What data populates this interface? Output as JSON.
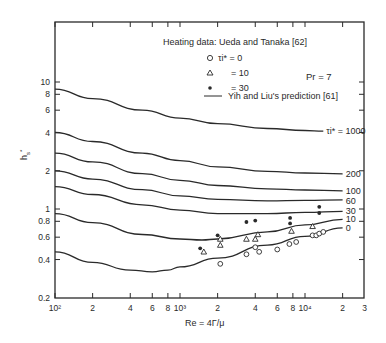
{
  "chart_data": {
    "type": "line",
    "title": "",
    "xlabel": "Re = 4Γ/μ",
    "ylabel": "h*_s",
    "xscale": "log",
    "yscale": "log",
    "xlim": [
      100,
      30000
    ],
    "ylim": [
      0.2,
      20
    ],
    "grid": false,
    "x_ticks": [
      {
        "v": 100,
        "label": "10²"
      },
      {
        "v": 200,
        "label": "2"
      },
      {
        "v": 400,
        "label": "4"
      },
      {
        "v": 600,
        "label": "6"
      },
      {
        "v": 800,
        "label": "8"
      },
      {
        "v": 1000,
        "label": "10³"
      },
      {
        "v": 2000,
        "label": "2"
      },
      {
        "v": 4000,
        "label": "4"
      },
      {
        "v": 6000,
        "label": "6"
      },
      {
        "v": 8000,
        "label": "8"
      },
      {
        "v": 10000,
        "label": "10⁴"
      },
      {
        "v": 20000,
        "label": "2"
      },
      {
        "v": 30000,
        "label": "3"
      }
    ],
    "y_ticks": [
      {
        "v": 0.2,
        "label": "0.2"
      },
      {
        "v": 0.4,
        "label": "0.4"
      },
      {
        "v": 0.6,
        "label": "0.6"
      },
      {
        "v": 0.8,
        "label": "0.8"
      },
      {
        "v": 1,
        "label": "1"
      },
      {
        "v": 2,
        "label": "2"
      },
      {
        "v": 4,
        "label": "4"
      },
      {
        "v": 6,
        "label": "6"
      },
      {
        "v": 8,
        "label": "8"
      },
      {
        "v": 10,
        "label": "10"
      }
    ],
    "legend": {
      "heading": "Heating data: Ueda and Tanaka [62]",
      "entries": [
        {
          "marker": "open-circle",
          "label": "τi* = 0"
        },
        {
          "marker": "open-triangle",
          "label": "= 10"
        },
        {
          "marker": "filled-circle",
          "label": "= 30"
        },
        {
          "marker": "line",
          "label": "Yih and Liu's prediction [61]"
        }
      ],
      "annotation": "Pr = 7"
    },
    "series": [
      {
        "name": "τi* = 1000",
        "label": "τi* = 1000",
        "x": [
          100,
          200,
          500,
          1000,
          2000,
          5000,
          10000,
          14000
        ],
        "y": [
          8.8,
          7.4,
          6.0,
          5.2,
          4.7,
          4.3,
          4.15,
          4.1
        ]
      },
      {
        "name": "200",
        "label": "200",
        "x": [
          100,
          200,
          500,
          1000,
          2000,
          5000,
          10000,
          20000
        ],
        "y": [
          4.0,
          3.4,
          2.75,
          2.4,
          2.15,
          1.98,
          1.92,
          1.89
        ]
      },
      {
        "name": "100",
        "label": "100",
        "x": [
          100,
          200,
          500,
          1000,
          2000,
          5000,
          10000,
          20000
        ],
        "y": [
          2.75,
          2.35,
          1.9,
          1.68,
          1.53,
          1.44,
          1.41,
          1.39
        ]
      },
      {
        "name": "60",
        "label": "60",
        "x": [
          100,
          200,
          500,
          1000,
          2000,
          5000,
          10000,
          20000
        ],
        "y": [
          2.0,
          1.72,
          1.42,
          1.27,
          1.19,
          1.16,
          1.17,
          1.18
        ]
      },
      {
        "name": "30",
        "label": "30",
        "x": [
          100,
          200,
          500,
          1000,
          2000,
          5000,
          10000,
          20000
        ],
        "y": [
          1.5,
          1.3,
          1.08,
          0.98,
          0.92,
          0.92,
          0.94,
          0.96
        ]
      },
      {
        "name": "10",
        "label": "10",
        "x": [
          100,
          200,
          500,
          1000,
          1500,
          2000,
          5000,
          10000,
          20000
        ],
        "y": [
          0.92,
          0.78,
          0.63,
          0.58,
          0.57,
          0.58,
          0.66,
          0.75,
          0.83
        ]
      },
      {
        "name": "0",
        "label": "0",
        "x": [
          100,
          200,
          400,
          600,
          800,
          1000,
          2000,
          5000,
          10000,
          20000
        ],
        "y": [
          0.46,
          0.38,
          0.33,
          0.32,
          0.33,
          0.35,
          0.41,
          0.52,
          0.61,
          0.71
        ]
      }
    ],
    "scatter": [
      {
        "name": "τi* = 0",
        "marker": "open-circle",
        "points": [
          [
            2100,
            0.37
          ],
          [
            3400,
            0.44
          ],
          [
            4000,
            0.5
          ],
          [
            4300,
            0.46
          ],
          [
            6000,
            0.48
          ],
          [
            7500,
            0.53
          ],
          [
            8500,
            0.55
          ],
          [
            11500,
            0.62
          ],
          [
            12300,
            0.62
          ],
          [
            13000,
            0.64
          ],
          [
            14000,
            0.66
          ]
        ]
      },
      {
        "name": "τi* = 10",
        "marker": "open-triangle",
        "points": [
          [
            1550,
            0.46
          ],
          [
            2100,
            0.58
          ],
          [
            2100,
            0.52
          ],
          [
            3400,
            0.58
          ],
          [
            4000,
            0.58
          ],
          [
            4200,
            0.63
          ],
          [
            7800,
            0.67
          ],
          [
            11500,
            0.73
          ]
        ]
      },
      {
        "name": "τi* = 30",
        "marker": "filled-circle",
        "points": [
          [
            1450,
            0.49
          ],
          [
            2000,
            0.62
          ],
          [
            3400,
            0.79
          ],
          [
            4000,
            0.81
          ],
          [
            7600,
            0.85
          ],
          [
            7600,
            0.77
          ],
          [
            13000,
            1.04
          ],
          [
            13000,
            0.93
          ]
        ]
      }
    ]
  }
}
